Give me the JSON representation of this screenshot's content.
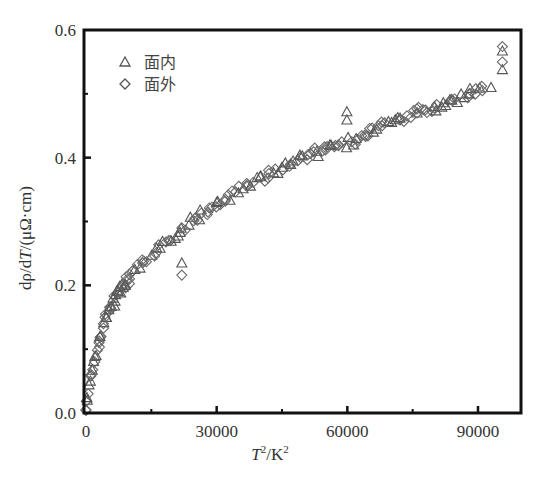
{
  "chart_data": {
    "type": "scatter",
    "title": "",
    "xlabel": "T²/K²",
    "ylabel": "dρ/dT/(μΩ·cm)",
    "xlim": [
      0,
      100000
    ],
    "ylim": [
      0,
      0.6
    ],
    "x_ticks": [
      0,
      30000,
      60000,
      90000
    ],
    "x_tick_labels": [
      "0",
      "30000",
      "60000",
      "90000"
    ],
    "x_minor_ticks": [
      15000,
      45000,
      75000
    ],
    "y_ticks": [
      0.0,
      0.2,
      0.4,
      0.6
    ],
    "y_tick_labels": [
      "0.0",
      "0.2",
      "0.4",
      "0.6"
    ],
    "y_minor_ticks": [
      0.1,
      0.3,
      0.5
    ],
    "grid": false,
    "legend_position": "upper left",
    "series": [
      {
        "name": "面内",
        "marker": "triangle-open",
        "x": [
          300,
          1000,
          2300,
          3200,
          4600,
          6200,
          9000,
          12400,
          17000,
          21600,
          22000,
          26200,
          30000,
          35000,
          40000,
          45000,
          49100,
          53000,
          56000,
          59900,
          59900,
          62000,
          66000,
          72100,
          76000,
          80000,
          84000,
          88000,
          90400,
          93000,
          95600,
          95600
        ],
        "y": [
          0.02,
          0.05,
          0.09,
          0.12,
          0.15,
          0.18,
          0.2,
          0.227,
          0.258,
          0.283,
          0.235,
          0.318,
          0.33,
          0.345,
          0.37,
          0.385,
          0.404,
          0.41,
          0.42,
          0.472,
          0.459,
          0.43,
          0.44,
          0.462,
          0.47,
          0.48,
          0.49,
          0.5,
          0.509,
          0.51,
          0.567,
          0.538
        ]
      },
      {
        "name": "面外",
        "marker": "diamond-open",
        "x": [
          0,
          500,
          1200,
          2000,
          3000,
          4000,
          5500,
          7500,
          10000,
          13000,
          16000,
          19000,
          22000,
          22000,
          25000,
          28000,
          32000,
          37000,
          42000,
          47000,
          51000,
          55000,
          58000,
          61000,
          64000,
          68000,
          72000,
          76000,
          80000,
          84000,
          88000,
          91000,
          95600,
          95600
        ],
        "y": [
          0.005,
          0.03,
          0.06,
          0.08,
          0.11,
          0.14,
          0.165,
          0.19,
          0.21,
          0.235,
          0.25,
          0.27,
          0.29,
          0.216,
          0.305,
          0.315,
          0.335,
          0.355,
          0.375,
          0.39,
          0.405,
          0.412,
          0.42,
          0.425,
          0.435,
          0.45,
          0.46,
          0.47,
          0.478,
          0.49,
          0.5,
          0.505,
          0.574,
          0.55
        ]
      }
    ]
  },
  "legend": {
    "items": [
      {
        "label": "面内",
        "marker": "triangle"
      },
      {
        "label": "面外",
        "marker": "diamond"
      }
    ]
  },
  "axes": {
    "xlabel_main": "T",
    "xlabel_sup": "2",
    "xlabel_rest": "/K",
    "xlabel_sup2": "2",
    "ylabel_prefix": "dρ/d",
    "ylabel_T": "T",
    "ylabel_suffix": "/(μΩ·cm)"
  },
  "colors": {
    "frame": "#111111",
    "marker_stroke": "#6a6a6a",
    "text": "#333333"
  }
}
